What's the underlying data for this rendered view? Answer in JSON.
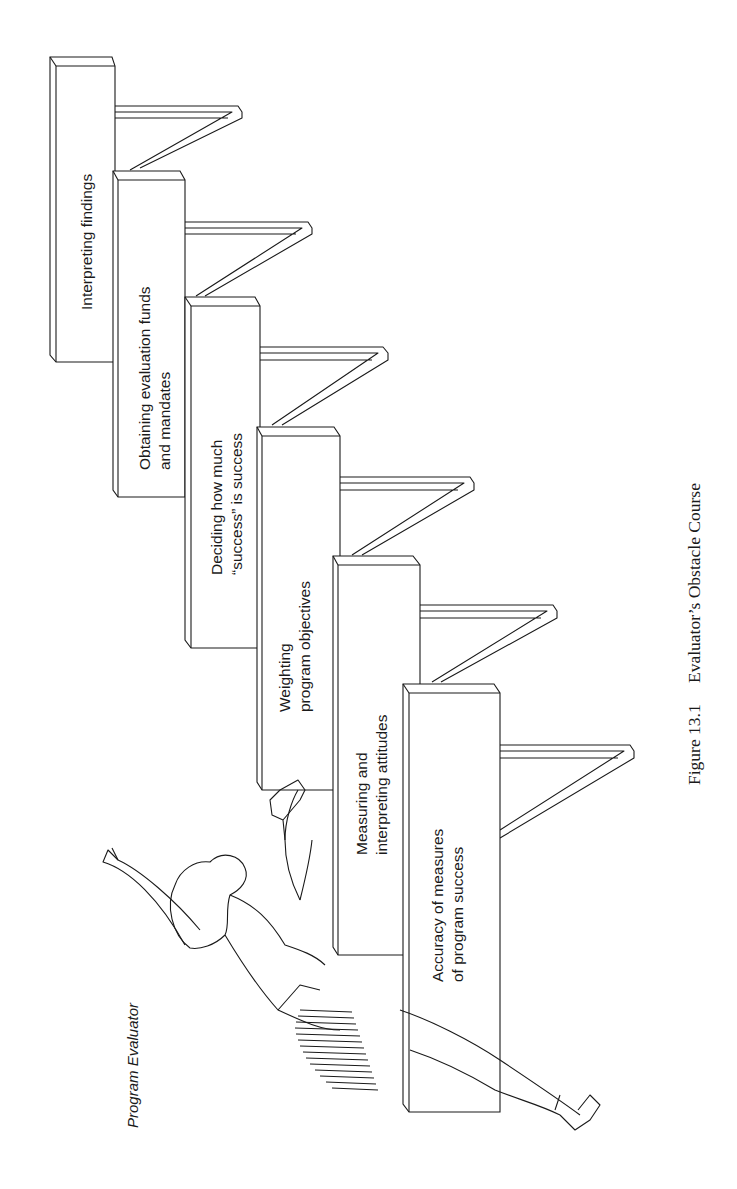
{
  "figure": {
    "caption_number": "Figure 13.1",
    "caption_title": "Evaluator’s Obstacle Course",
    "character_label": "Program Evaluator",
    "orientation": "rotated 90° counter-clockwise (landscape figure on portrait page)"
  },
  "hurdles": [
    {
      "order": 1,
      "lines": [
        "Accuracy of measures",
        "of program success"
      ]
    },
    {
      "order": 2,
      "lines": [
        "Measuring and",
        "interpreting attitudes"
      ]
    },
    {
      "order": 3,
      "lines": [
        "Weighting",
        "program objectives"
      ]
    },
    {
      "order": 4,
      "lines": [
        "Deciding how much",
        "“success” is success"
      ]
    },
    {
      "order": 5,
      "lines": [
        "Obtaining evaluation funds",
        "and mandates"
      ]
    },
    {
      "order": 6,
      "lines": [
        "Interpreting findings"
      ]
    }
  ]
}
